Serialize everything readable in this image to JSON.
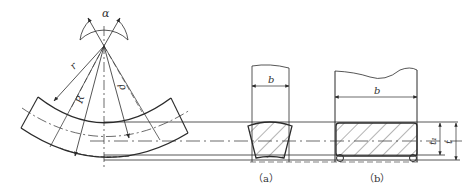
{
  "diagram": {
    "labels": {
      "alpha": "α",
      "r": "r",
      "R": "R",
      "rho": "ρ",
      "b_a": "b",
      "b_b": "b",
      "t1": "t₁",
      "t": "t"
    },
    "captions": {
      "a": "（a）",
      "b": "（b）"
    },
    "colors": {
      "line": "#2b2b2b",
      "thin": "#555555",
      "background": "#ffffff"
    }
  }
}
